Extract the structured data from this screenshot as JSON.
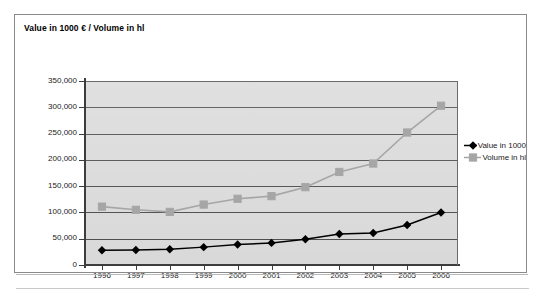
{
  "chart_title": "Value in 1000 € / Volume in hl",
  "legend": {
    "entries": [
      {
        "label": "Value in 1000",
        "color": "#000000",
        "marker": "diamond"
      },
      {
        "label": "Volume in hl",
        "color": "#a6a6a6",
        "marker": "square"
      }
    ]
  },
  "chart_data": {
    "type": "line",
    "title": "Value in 1000 € / Volume in hl",
    "xlabel": "",
    "ylabel": "",
    "categories": [
      "1996",
      "1997",
      "1998",
      "1999",
      "2000",
      "2001",
      "2002",
      "2003",
      "2004",
      "2005",
      "2006"
    ],
    "yticks": [
      "0",
      "50,000",
      "100,000",
      "150,000",
      "200,000",
      "250,000",
      "300,000",
      "350,000"
    ],
    "ytick_values": [
      0,
      50000,
      100000,
      150000,
      200000,
      250000,
      300000,
      350000
    ],
    "ylim": [
      0,
      350000
    ],
    "grid": true,
    "legend_position": "right",
    "series": [
      {
        "name": "Value in 1000",
        "color": "#000000",
        "marker": "diamond",
        "values": [
          28000,
          28500,
          30000,
          34000,
          39000,
          42000,
          49000,
          59000,
          61000,
          76000,
          100000
        ]
      },
      {
        "name": "Volume in hl",
        "color": "#a6a6a6",
        "marker": "square",
        "values": [
          111000,
          105000,
          101000,
          115000,
          126000,
          131000,
          148000,
          177000,
          193000,
          252000,
          303000
        ]
      }
    ]
  },
  "colors": {
    "plot_background": "#d9d9d9",
    "gridline": "#4a4a4a",
    "axis": "#3d3d3d",
    "frame_border": "#8a8a8a",
    "value_series": "#000000",
    "volume_series": "#a6a6a6"
  }
}
